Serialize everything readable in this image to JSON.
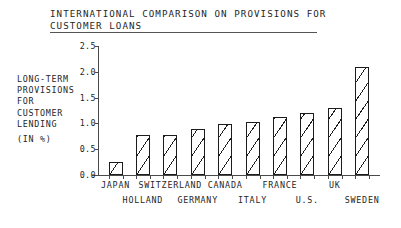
{
  "chart": {
    "title_lines": [
      "INTERNATIONAL COMPARISON ON PROVISIONS FOR",
      "CUSTOMER LOANS"
    ],
    "y_caption_lines": [
      "LONG-TERM",
      "PROVISIONS",
      "FOR",
      "CUSTOMER",
      "LENDING",
      "(IN %)"
    ],
    "y_tick_labels": [
      "2.5",
      "2.0",
      "1.5",
      "1.0",
      "0.5",
      "0.0"
    ]
  },
  "chart_data": {
    "type": "bar",
    "title": "INTERNATIONAL COMPARISON ON PROVISIONS FOR CUSTOMER LOANS",
    "subtitle": "",
    "xlabel": "",
    "ylabel": "LONG-TERM PROVISIONS FOR CUSTOMER LENDING (IN %)",
    "ylim": [
      0.0,
      2.5
    ],
    "yticks": [
      0.0,
      0.5,
      1.0,
      1.5,
      2.0,
      2.5
    ],
    "grid": false,
    "legend": false,
    "legend_position": "none",
    "bar_style": "diagonal-hatch-outline",
    "categories": [
      "JAPAN",
      "HOLLAND",
      "SWITZERLAND",
      "GERMANY",
      "CANADA",
      "ITALY",
      "FRANCE",
      "U.S.",
      "UK",
      "SWEDEN"
    ],
    "values": [
      0.25,
      0.78,
      0.78,
      0.89,
      0.98,
      1.03,
      1.13,
      1.21,
      1.29,
      2.09
    ],
    "label_rows": [
      0,
      1,
      0,
      1,
      0,
      1,
      0,
      1,
      0,
      1
    ]
  }
}
